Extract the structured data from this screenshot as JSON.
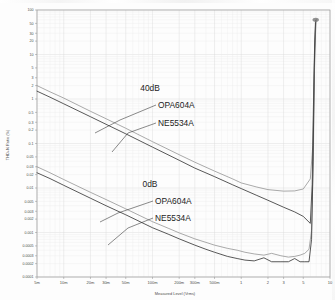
{
  "chart_data": {
    "type": "line",
    "title": "",
    "xlabel": "Measured Level (Vrms)",
    "ylabel": "THD+N Ratio (%)",
    "xscale": "log",
    "yscale": "log",
    "xlim": [
      0.005,
      10
    ],
    "ylim": [
      0.0001,
      100
    ],
    "grid": true,
    "legend_position": "inline-annotations",
    "xticks": [
      "5m",
      "10m",
      "20m",
      "30m",
      "50m",
      "100m",
      "200m",
      "300m",
      "500m",
      "1",
      "2",
      "3",
      "5",
      "10"
    ],
    "xtick_values": [
      0.005,
      0.01,
      0.02,
      0.03,
      0.05,
      0.1,
      0.2,
      0.3,
      0.5,
      1,
      2,
      3,
      5,
      10
    ],
    "yticks": [
      "100",
      "50",
      "30",
      "20",
      "10",
      "5",
      "3",
      "2",
      "1",
      "0.5",
      "0.3",
      "0.2",
      "0.1",
      "0.05",
      "0.03",
      "0.02",
      "0.01",
      "0.005",
      "0.003",
      "0.002",
      "0.001",
      "0.0005",
      "0.0003",
      "0.0002",
      "0.0001"
    ],
    "ytick_values": [
      100,
      50,
      30,
      20,
      10,
      5,
      3,
      2,
      1,
      0.5,
      0.3,
      0.2,
      0.1,
      0.05,
      0.03,
      0.02,
      0.01,
      0.005,
      0.003,
      0.002,
      0.001,
      0.0005,
      0.0003,
      0.0002,
      0.0001
    ],
    "annotations": [
      {
        "id": "gain-40db",
        "text": "40dB"
      },
      {
        "id": "opa604a-40db",
        "text": "OPA604A"
      },
      {
        "id": "ne5534a-40db",
        "text": "NE5534A"
      },
      {
        "id": "gain-0db",
        "text": "0dB"
      },
      {
        "id": "opa604a-0db",
        "text": "OPA604A"
      },
      {
        "id": "ne5534a-0db",
        "text": "NE5534A"
      }
    ],
    "series": [
      {
        "name": "OPA604A 40dB",
        "gain": "40dB",
        "device": "OPA604A",
        "color": "#8e8e8e",
        "x": [
          0.005,
          0.007,
          0.01,
          0.02,
          0.03,
          0.05,
          0.1,
          0.2,
          0.3,
          0.5,
          0.8,
          1.0,
          1.5,
          2.0,
          3.0,
          4.0,
          5.0,
          6.0,
          6.4,
          6.6,
          6.8,
          7.0
        ],
        "y": [
          2.0,
          1.45,
          1.05,
          0.53,
          0.36,
          0.22,
          0.11,
          0.056,
          0.038,
          0.024,
          0.016,
          0.013,
          0.0105,
          0.0092,
          0.0085,
          0.0086,
          0.0095,
          0.016,
          0.09,
          1.2,
          20,
          62
        ]
      },
      {
        "name": "NE5534A 40dB",
        "gain": "40dB",
        "device": "NE5534A",
        "color": "#3a3a3a",
        "x": [
          0.005,
          0.007,
          0.01,
          0.02,
          0.03,
          0.05,
          0.1,
          0.2,
          0.3,
          0.5,
          0.8,
          1.0,
          1.5,
          2.0,
          3.0,
          4.0,
          5.0,
          6.0,
          6.3,
          6.5,
          6.7,
          6.9
        ],
        "y": [
          1.5,
          1.1,
          0.78,
          0.4,
          0.27,
          0.165,
          0.083,
          0.042,
          0.028,
          0.018,
          0.0118,
          0.0097,
          0.0068,
          0.0053,
          0.0037,
          0.0029,
          0.0023,
          0.0016,
          0.012,
          0.6,
          14,
          58
        ]
      },
      {
        "name": "OPA604A 0dB",
        "gain": "0dB",
        "device": "OPA604A",
        "color": "#8e8e8e",
        "x": [
          0.005,
          0.007,
          0.01,
          0.02,
          0.03,
          0.05,
          0.1,
          0.15,
          0.2,
          0.3,
          0.4,
          0.5,
          0.7,
          0.9,
          1.1,
          1.4,
          1.8,
          2.2,
          2.8,
          3.4,
          4.0,
          4.6,
          5.2,
          5.8,
          6.2,
          6.5,
          6.7,
          6.9
        ],
        "y": [
          0.03,
          0.022,
          0.0155,
          0.008,
          0.0055,
          0.0034,
          0.00175,
          0.00125,
          0.00098,
          0.00072,
          0.0006,
          0.00052,
          0.00044,
          0.0004,
          0.00036,
          0.00033,
          0.00031,
          0.00034,
          0.0003,
          0.00028,
          0.00029,
          0.00031,
          0.00034,
          0.00042,
          0.0011,
          0.05,
          6,
          55
        ]
      },
      {
        "name": "NE5534A 0dB",
        "gain": "0dB",
        "device": "NE5534A",
        "color": "#3a3a3a",
        "x": [
          0.005,
          0.007,
          0.01,
          0.02,
          0.03,
          0.05,
          0.1,
          0.15,
          0.2,
          0.3,
          0.4,
          0.5,
          0.7,
          0.9,
          1.1,
          1.4,
          1.8,
          2.2,
          2.8,
          3.4,
          4.0,
          4.6,
          5.2,
          5.8,
          6.2,
          6.45,
          6.65,
          6.85
        ],
        "y": [
          0.022,
          0.0163,
          0.0115,
          0.0059,
          0.004,
          0.0025,
          0.00128,
          0.00092,
          0.00072,
          0.00052,
          0.00042,
          0.00036,
          0.00029,
          0.00026,
          0.00024,
          0.00023,
          0.00027,
          0.00022,
          0.00022,
          0.00022,
          0.00026,
          0.00022,
          0.00022,
          0.00022,
          0.0007,
          0.04,
          5,
          52
        ]
      }
    ]
  }
}
